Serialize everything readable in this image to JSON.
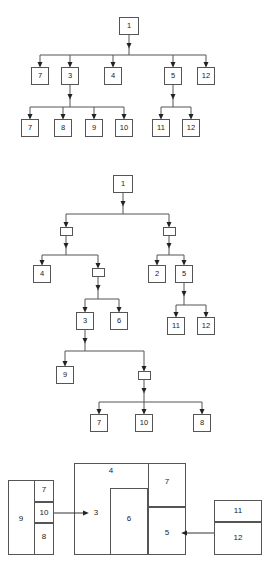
{
  "figure": {
    "title": "",
    "background": "#ffffff",
    "line_color": "#555555",
    "text_color": "#222222"
  },
  "diagram_top": {
    "name": "call-tree-1",
    "levels": [
      {
        "nodes": [
          {
            "label": "1",
            "x": 119,
            "y": 17,
            "w": 20,
            "h": 18
          }
        ]
      },
      {
        "nodes": [
          {
            "label": "7",
            "x": 31,
            "y": 67,
            "w": 18,
            "h": 18
          },
          {
            "label": "3",
            "x": 61,
            "y": 67,
            "w": 18,
            "h": 18
          },
          {
            "label": "4",
            "x": 104,
            "y": 67,
            "w": 18,
            "h": 18
          },
          {
            "label": "5",
            "x": 164,
            "y": 67,
            "w": 18,
            "h": 18
          },
          {
            "label": "12",
            "x": 197,
            "y": 67,
            "w": 18,
            "h": 18
          }
        ]
      },
      {
        "nodes": [
          {
            "label": "7",
            "x": 21,
            "y": 119,
            "w": 18,
            "h": 18
          },
          {
            "label": "8",
            "x": 54,
            "y": 119,
            "w": 18,
            "h": 18
          },
          {
            "label": "9",
            "x": 85,
            "y": 119,
            "w": 18,
            "h": 18
          },
          {
            "label": "10",
            "x": 115,
            "y": 119,
            "w": 18,
            "h": 18
          },
          {
            "label": "11",
            "x": 152,
            "y": 119,
            "w": 18,
            "h": 18
          },
          {
            "label": "12",
            "x": 182,
            "y": 119,
            "w": 18,
            "h": 18
          }
        ]
      }
    ],
    "edges": [
      {
        "from": "1",
        "to": [
          "7",
          "3",
          "4",
          "5",
          "12"
        ]
      },
      {
        "from": "3",
        "to": [
          "7",
          "8",
          "9",
          "10"
        ]
      },
      {
        "from": "5",
        "to": [
          "11",
          "12"
        ]
      }
    ]
  },
  "diagram_middle": {
    "name": "call-tree-2",
    "nodes": [
      {
        "id": "m1",
        "label": "1",
        "x": 113,
        "y": 175,
        "w": 20,
        "h": 18
      },
      {
        "id": "mA",
        "label": "",
        "x": 60,
        "y": 227,
        "w": 13,
        "h": 9
      },
      {
        "id": "mB",
        "label": "",
        "x": 163,
        "y": 227,
        "w": 13,
        "h": 9
      },
      {
        "id": "m4",
        "label": "4",
        "x": 33,
        "y": 265,
        "w": 18,
        "h": 18
      },
      {
        "id": "mC",
        "label": "",
        "x": 92,
        "y": 268,
        "w": 13,
        "h": 9
      },
      {
        "id": "m2",
        "label": "2",
        "x": 148,
        "y": 265,
        "w": 18,
        "h": 18
      },
      {
        "id": "m5",
        "label": "5",
        "x": 175,
        "y": 265,
        "w": 18,
        "h": 18
      },
      {
        "id": "m3",
        "label": "3",
        "x": 76,
        "y": 312,
        "w": 18,
        "h": 18
      },
      {
        "id": "m6",
        "label": "6",
        "x": 110,
        "y": 312,
        "w": 18,
        "h": 18
      },
      {
        "id": "m11",
        "label": "11",
        "x": 167,
        "y": 317,
        "w": 18,
        "h": 18
      },
      {
        "id": "m12",
        "label": "12",
        "x": 197,
        "y": 317,
        "w": 18,
        "h": 18
      },
      {
        "id": "m9",
        "label": "9",
        "x": 56,
        "y": 366,
        "w": 18,
        "h": 18
      },
      {
        "id": "mD",
        "label": "",
        "x": 138,
        "y": 371,
        "w": 13,
        "h": 9
      },
      {
        "id": "m7",
        "label": "7",
        "x": 90,
        "y": 414,
        "w": 18,
        "h": 18
      },
      {
        "id": "m10",
        "label": "10",
        "x": 138,
        "y": 414,
        "w": 18,
        "h": 18
      },
      {
        "id": "m8",
        "label": "8",
        "x": 193,
        "y": 414,
        "w": 18,
        "h": 18
      }
    ],
    "edges": [
      {
        "from": "m1",
        "to": [
          "mA",
          "mB"
        ]
      },
      {
        "from": "mA",
        "to": [
          "m4",
          "mC"
        ]
      },
      {
        "from": "mB",
        "to": [
          "m2",
          "m5"
        ]
      },
      {
        "from": "mC",
        "to": [
          "m3",
          "m6"
        ]
      },
      {
        "from": "m5",
        "to": [
          "m11",
          "m12"
        ]
      },
      {
        "from": "m3",
        "to": [
          "m9",
          "mD"
        ]
      },
      {
        "from": "mD",
        "to": [
          "m7",
          "m10",
          "m8"
        ]
      }
    ]
  },
  "diagram_bottom": {
    "name": "block-packing-diagram",
    "blocks": [
      {
        "label": "9",
        "x": 8,
        "y": 480,
        "w": 27,
        "h": 75,
        "label_x": 21,
        "label_y": 519
      },
      {
        "label": "7",
        "x": 35,
        "y": 480,
        "w": 19,
        "h": 22,
        "label_x": 44,
        "label_y": 490
      },
      {
        "label": "10",
        "x": 35,
        "y": 502,
        "w": 19,
        "h": 21,
        "label_x": 44,
        "label_y": 513
      },
      {
        "label": "8",
        "x": 35,
        "y": 523,
        "w": 19,
        "h": 32,
        "label_x": 44,
        "label_y": 537
      },
      {
        "label": "4",
        "x": 74,
        "y": 463,
        "w": 74,
        "h": 92,
        "label_x": 111,
        "label_y": 471
      },
      {
        "label": "3",
        "x": 74,
        "y": 463,
        "w": 0,
        "h": 0,
        "label_x": 96,
        "label_y": 513
      },
      {
        "label": "6",
        "x": 110,
        "y": 488,
        "w": 38,
        "h": 67,
        "label_x": 129,
        "label_y": 519
      },
      {
        "label": "7",
        "x": 148,
        "y": 463,
        "w": 38,
        "h": 44,
        "label_x": 167,
        "label_y": 482
      },
      {
        "label": "5",
        "x": 148,
        "y": 507,
        "w": 38,
        "h": 48,
        "label_x": 167,
        "label_y": 533
      },
      {
        "label": "11",
        "x": 214,
        "y": 500,
        "w": 48,
        "h": 22,
        "label_x": 238,
        "label_y": 511
      },
      {
        "label": "12",
        "x": 214,
        "y": 522,
        "w": 48,
        "h": 33,
        "label_x": 238,
        "label_y": 538
      }
    ],
    "arrows": [
      {
        "name": "arrow-10-to-3",
        "x1": 54,
        "y1": 513,
        "x2": 90,
        "y2": 513
      },
      {
        "name": "arrow-12-to-5",
        "x1": 214,
        "y1": 533,
        "x2": 180,
        "y2": 533
      }
    ]
  }
}
